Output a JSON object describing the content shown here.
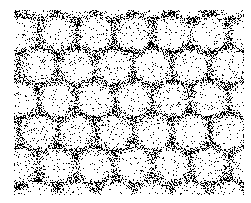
{
  "image": {
    "description": "Stippled texture of light circular blobs arranged in a diagonal lattice, separated by dense black dot clusters",
    "background": "#ffffff",
    "dot_color": "#000000",
    "field": {
      "x0": 14,
      "y0": 10,
      "x1": 244,
      "y1": 195
    },
    "lattice": {
      "spacing_x": 38,
      "spacing_y": 33,
      "row_shift": 19,
      "blob_radius": 17
    },
    "density": {
      "base": 0.05,
      "edge": 0.55
    },
    "seed": 7
  }
}
